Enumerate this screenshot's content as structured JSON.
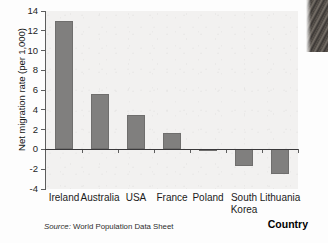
{
  "figure": {
    "source_prefix": "Source:",
    "source_text": "World Population Data Sheet"
  },
  "chart_data": {
    "type": "bar",
    "title": "",
    "xlabel": "Country",
    "ylabel": "Net migration rate (per 1,000)",
    "categories": [
      "Ireland",
      "Australia",
      "USA",
      "France",
      "Poland",
      "South Korea",
      "Lithuania"
    ],
    "category_lines": [
      [
        "Ireland"
      ],
      [
        "Australia"
      ],
      [
        "USA"
      ],
      [
        "France"
      ],
      [
        "Poland"
      ],
      [
        "South",
        "Korea"
      ],
      [
        "Lithuania"
      ]
    ],
    "values": [
      13.0,
      5.6,
      3.5,
      1.7,
      -0.2,
      -1.7,
      -2.5
    ],
    "ylim": [
      -4,
      14
    ],
    "ytick_labels": [
      "14",
      "12",
      "10",
      "8",
      "6",
      "4",
      "2",
      "0",
      "-2",
      "-4"
    ],
    "yticks": [
      14,
      12,
      10,
      8,
      6,
      4,
      2,
      0,
      -2,
      -4
    ],
    "grid": false,
    "legend": null,
    "bar_color": "#807f7e",
    "plot_background": "#f2f1f0",
    "axis_color": "#5d5d5d"
  }
}
